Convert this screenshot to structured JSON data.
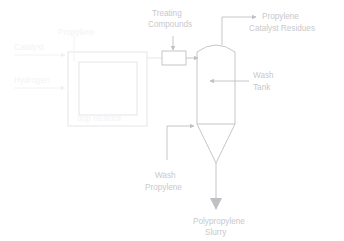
{
  "diagram": {
    "type": "process-flow-diagram",
    "background_color": "#ffffff",
    "line_color": "#bfbfc4",
    "faded_line_color": "#e2e2e6",
    "text_color": "#c9c9cc"
  },
  "labels": {
    "treating_compounds_line1": "Treating",
    "treating_compounds_line2": "Compounds",
    "propylene_residues_line1": "Propylene",
    "propylene_residues_line2": "Catalyst Residues",
    "wash_tank_line1": "Wash",
    "wash_tank_line2": "Tank",
    "wash_propylene_line1": "Wash",
    "wash_propylene_line2": "Propylene",
    "polypropylene_slurry_line1": "Polypropylene",
    "polypropylene_slurry_line2": "Slurry",
    "loop_reactor": "oop Reactor",
    "reactor_top_label": "Propylene",
    "inlet_upper": "Catalyst",
    "inlet_lower": "Hydrogen"
  },
  "equipment": {
    "loop_reactor_name": "Loop Reactor",
    "treating_vessel_name": "Treating Compounds Vessel",
    "wash_tank_name": "Wash Tank"
  },
  "streams": {
    "inlet_upper_name": "upper-feed-inlet",
    "inlet_lower_name": "lower-feed-inlet",
    "reactor_to_treating": "reactor-outlet-to-treating",
    "treating_to_tank": "treating-outlet-to-wash-tank",
    "treating_compounds_feed": "treating-compounds-feed",
    "overhead_vent": "overhead-vent-stream",
    "wash_propylene_feed": "wash-propylene-feed",
    "slurry_outlet": "polypropylene-slurry-outlet"
  }
}
